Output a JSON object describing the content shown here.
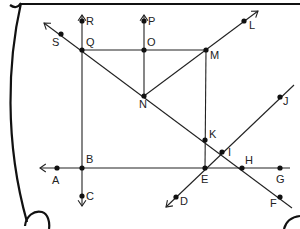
{
  "diagram": {
    "colors": {
      "stroke": "#222222",
      "background": "#ffffff"
    },
    "points": [
      {
        "id": "A",
        "label": "A",
        "x": 57,
        "y": 168,
        "lx": 52,
        "ly": 184
      },
      {
        "id": "B",
        "label": "B",
        "x": 82,
        "y": 168,
        "lx": 86,
        "ly": 163
      },
      {
        "id": "C",
        "label": "C",
        "x": 82,
        "y": 196,
        "lx": 86,
        "ly": 200
      },
      {
        "id": "D",
        "label": "D",
        "x": 176,
        "y": 197,
        "lx": 180,
        "ly": 205
      },
      {
        "id": "E",
        "label": "E",
        "x": 205,
        "y": 168,
        "lx": 201,
        "ly": 183
      },
      {
        "id": "F",
        "label": "F",
        "x": 280,
        "y": 197,
        "lx": 270,
        "ly": 207
      },
      {
        "id": "G",
        "label": "G",
        "x": 280,
        "y": 168,
        "lx": 276,
        "ly": 183
      },
      {
        "id": "H",
        "label": "H",
        "x": 242,
        "y": 168,
        "lx": 245,
        "ly": 164
      },
      {
        "id": "I",
        "label": "I",
        "x": 222,
        "y": 152,
        "lx": 228,
        "ly": 156
      },
      {
        "id": "J",
        "label": "J",
        "x": 280,
        "y": 97,
        "lx": 283,
        "ly": 105
      },
      {
        "id": "K",
        "label": "K",
        "x": 205,
        "y": 140,
        "lx": 209,
        "ly": 138
      },
      {
        "id": "L",
        "label": "L",
        "x": 244,
        "y": 21,
        "lx": 249,
        "ly": 29
      },
      {
        "id": "M",
        "label": "M",
        "x": 206,
        "y": 50,
        "lx": 210,
        "ly": 59
      },
      {
        "id": "N",
        "label": "N",
        "x": 144,
        "y": 96,
        "lx": 139,
        "ly": 108
      },
      {
        "id": "O",
        "label": "O",
        "x": 144,
        "y": 50,
        "lx": 147,
        "ly": 46
      },
      {
        "id": "P",
        "label": "P",
        "x": 144,
        "y": 21,
        "lx": 148,
        "ly": 25
      },
      {
        "id": "Q",
        "label": "Q",
        "x": 82,
        "y": 50,
        "lx": 86,
        "ly": 46
      },
      {
        "id": "R",
        "label": "R",
        "x": 82,
        "y": 21,
        "lx": 86,
        "ly": 25
      },
      {
        "id": "S",
        "label": "S",
        "x": 61,
        "y": 34,
        "lx": 52,
        "ly": 46
      }
    ],
    "segments": [
      {
        "name": "segment-QM",
        "x1": 82,
        "y1": 50,
        "x2": 206,
        "y2": 50
      },
      {
        "name": "segment-ON",
        "x1": 144,
        "y1": 50,
        "x2": 144,
        "y2": 96
      },
      {
        "name": "segment-MK",
        "x1": 206,
        "y1": 50,
        "x2": 205,
        "y2": 168
      }
    ],
    "rays": [
      {
        "name": "ray-BR",
        "x1": 82,
        "y1": 168,
        "x2": 82,
        "y2": 15
      },
      {
        "name": "ray-OP",
        "x1": 144,
        "y1": 50,
        "x2": 144,
        "y2": 15
      },
      {
        "name": "ray-BC",
        "x1": 82,
        "y1": 168,
        "x2": 82,
        "y2": 206
      },
      {
        "name": "ray-NL",
        "x1": 144,
        "y1": 96,
        "x2": 258,
        "y2": 11
      },
      {
        "name": "ray-FS",
        "x1": 292,
        "y1": 208,
        "x2": 44,
        "y2": 23
      },
      {
        "name": "ray-JD",
        "x1": 294,
        "y1": 85,
        "x2": 166,
        "y2": 207
      },
      {
        "name": "ray-GA",
        "x1": 290,
        "y1": 168,
        "x2": 40,
        "y2": 168
      }
    ]
  }
}
